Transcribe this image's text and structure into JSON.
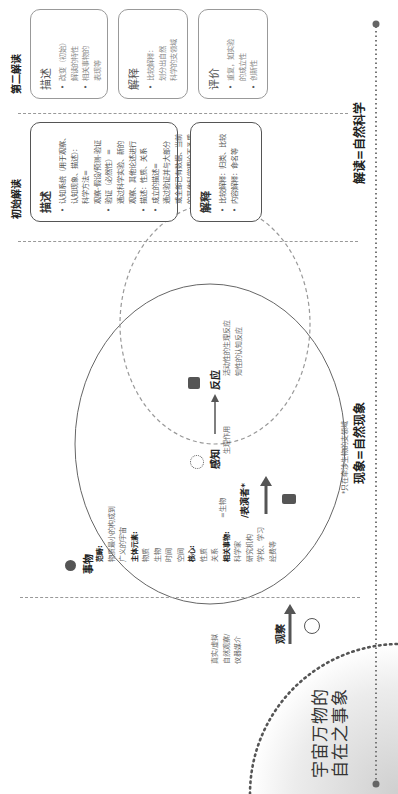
{
  "universe": {
    "line1": "宇宙万物的",
    "line2": "自在之事象"
  },
  "observe": {
    "label": "观察",
    "bullets": [
      "真实/虚拟",
      "自然观察/",
      "仪器媒介"
    ],
    "icon": "magnifier-icon"
  },
  "thing": {
    "title": "事物",
    "icon": "apple-icon",
    "scope_label": "范畴:",
    "scope_lines": [
      "物质最小的构成到",
      "广义的宇宙"
    ],
    "elements_label": "主体元素:",
    "elements": [
      "物质",
      "生物",
      "时间",
      "空间"
    ],
    "core_label": "核心:",
    "core": [
      "性质",
      "关系"
    ],
    "related_label": "相关事物:",
    "related": [
      "科学家",
      "研究机构",
      "学校、学习",
      "经费等"
    ]
  },
  "actor": {
    "eq": "=生物",
    "label": "/表演者*",
    "icon": "person-icon"
  },
  "perception": {
    "label": "感知",
    "icon": "sensing-icon",
    "bullets": [
      "生理作用"
    ]
  },
  "reaction": {
    "label": "反应",
    "icon": "signal-person-icon",
    "bullets": [
      "活动性的生理反应",
      "知性的认知反应"
    ]
  },
  "footnote": "*只在牵涉生物的支领域",
  "initial": {
    "title": "初始解读",
    "describe": {
      "heading": "描述",
      "lines": [
        {
          "b": true,
          "t": "认知系统（用于观察、"
        },
        {
          "b": false,
          "t": "认知现象、描述）："
        },
        {
          "b": false,
          "t": "科学方法="
        },
        {
          "b": false,
          "t": "观察-假设/预测-验证"
        },
        {
          "b": true,
          "t": "验证（必然性）="
        },
        {
          "b": false,
          "t": "通过科学实验、新的"
        },
        {
          "b": false,
          "t": "观察、其他论述进行"
        },
        {
          "b": true,
          "t": "描述：性质、关系"
        },
        {
          "b": true,
          "t": "成立的描述="
        },
        {
          "b": false,
          "t": "通过验证并与大部分"
        },
        {
          "b": false,
          "t": "或全部已有数据、当前"
        },
        {
          "b": false,
          "t": "的其他科学理论不矛盾"
        }
      ]
    },
    "explain": {
      "heading": "解释",
      "lines": [
        {
          "b": true,
          "t": "比较解释：归类、比较"
        },
        {
          "b": true,
          "t": "内容解释：命名等"
        }
      ]
    }
  },
  "second": {
    "title": "第二解读",
    "describe": {
      "heading": "描述",
      "lines": [
        {
          "b": true,
          "t": "改变（初始）"
        },
        {
          "b": false,
          "t": "解读的特性"
        },
        {
          "b": true,
          "t": "相关事物的"
        },
        {
          "b": false,
          "t": "表现等"
        }
      ]
    },
    "explain": {
      "heading": "解释",
      "lines": [
        {
          "b": true,
          "t": "比较解释："
        },
        {
          "b": false,
          "t": "划分出自然"
        },
        {
          "b": false,
          "t": "科学的支领域"
        }
      ]
    },
    "evaluate": {
      "heading": "评价",
      "lines": [
        {
          "b": true,
          "t": "重复，如实验"
        },
        {
          "b": false,
          "t": "的成立性"
        },
        {
          "b": true,
          "t": "创新性"
        }
      ]
    }
  },
  "footer": {
    "phenomenon": "现象=自然现象",
    "interpretation": "解读=自然科学"
  }
}
